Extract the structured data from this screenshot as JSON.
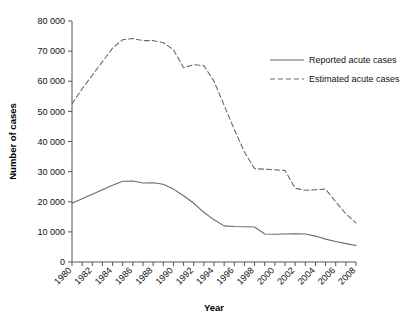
{
  "chart_data": {
    "type": "line",
    "title": "",
    "xlabel": "Year",
    "ylabel": "Number of cases",
    "xlim": [
      1980,
      2008
    ],
    "ylim": [
      0,
      80000
    ],
    "ytick_step": 10000,
    "xtick_step": 1,
    "xlabel_step": 2,
    "grid": false,
    "legend_position": "upper-right",
    "ytick_labels": [
      "0",
      "10 000",
      "20 000",
      "30 000",
      "40 000",
      "50 000",
      "60 000",
      "70 000",
      "80 000"
    ],
    "ytick_values": [
      0,
      10000,
      20000,
      30000,
      40000,
      50000,
      60000,
      70000,
      80000
    ],
    "xtick_labels": [
      "1980",
      "1982",
      "1984",
      "1986",
      "1988",
      "1990",
      "1992",
      "1994",
      "1996",
      "1998",
      "2000",
      "2002",
      "2004",
      "2006",
      "2008"
    ],
    "xtick_values": [
      1980,
      1982,
      1984,
      1986,
      1988,
      1990,
      1992,
      1994,
      1996,
      1998,
      2000,
      2002,
      2004,
      2006,
      2008
    ],
    "x": [
      1980,
      1981,
      1982,
      1983,
      1984,
      1985,
      1986,
      1987,
      1988,
      1989,
      1990,
      1991,
      1992,
      1993,
      1994,
      1995,
      1996,
      1997,
      1998,
      1999,
      2000,
      2001,
      2002,
      2003,
      2004,
      2005,
      2006,
      2007,
      2008
    ],
    "series": [
      {
        "name": "Reported acute cases",
        "style": "solid",
        "color": "#6b6b6b",
        "values": [
          19500,
          21000,
          22500,
          24000,
          25500,
          26800,
          26900,
          26200,
          26300,
          25800,
          24200,
          22000,
          19500,
          16500,
          14000,
          12000,
          11800,
          11700,
          11600,
          9300,
          9200,
          9300,
          9400,
          9300,
          8600,
          7600,
          6800,
          6100,
          5500
        ]
      },
      {
        "name": "Estimated acute cases",
        "style": "dashed",
        "color": "#6b6b6b",
        "values": [
          52500,
          57500,
          62000,
          66500,
          71000,
          73800,
          74200,
          73500,
          73500,
          72800,
          70500,
          64500,
          65500,
          65200,
          60000,
          52000,
          44000,
          36500,
          31000,
          30800,
          30600,
          30400,
          24500,
          23800,
          24000,
          24200,
          20000,
          16000,
          13000
        ]
      }
    ]
  },
  "legend": {
    "items": [
      {
        "label": "Reported acute cases",
        "style": "solid"
      },
      {
        "label": "Estimated acute cases",
        "style": "dashed"
      }
    ]
  }
}
